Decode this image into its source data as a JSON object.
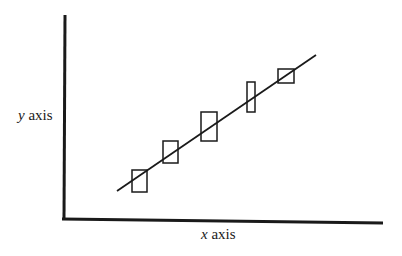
{
  "diagram": {
    "x_axis_label": {
      "var": "x",
      "text": " axis"
    },
    "y_axis_label": {
      "var": "y",
      "text": " axis"
    },
    "colors": {
      "stroke": "#1a1a1a",
      "background": "#ffffff"
    }
  },
  "chart_data": {
    "type": "scatter",
    "title": "",
    "xlabel": "x axis",
    "ylabel": "y axis",
    "grid": false,
    "ticks": false,
    "fit_line": {
      "x0": 117,
      "y0": 191,
      "x1": 316,
      "y1": 55
    },
    "boxes": [
      {
        "x": 132,
        "y": 170,
        "w": 15,
        "h": 22
      },
      {
        "x": 163,
        "y": 141,
        "w": 15,
        "h": 22
      },
      {
        "x": 201,
        "y": 112,
        "w": 16,
        "h": 29
      },
      {
        "x": 247,
        "y": 82,
        "w": 8,
        "h": 30
      },
      {
        "x": 278,
        "y": 69,
        "w": 16,
        "h": 14
      }
    ]
  }
}
